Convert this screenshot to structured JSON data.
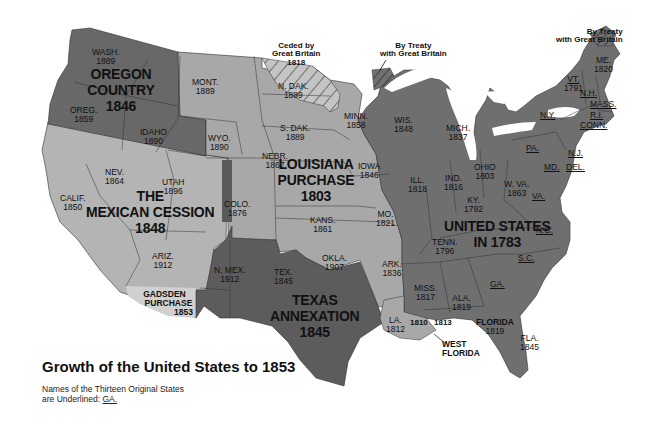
{
  "title": "Growth of the United States to 1853",
  "legend": {
    "line1": "Names of the Thirteen Original States",
    "line2_prefix": "are Underlined: ",
    "line2_example": "GA."
  },
  "colors": {
    "original_us": "#6e6e6e",
    "louisiana": "#a9a9a9",
    "oregon": "#6a6a6a",
    "mexican_cession": "#b4b4b4",
    "texas": "#5e5e5e",
    "florida": "#707070",
    "gadsden": "#cfcfcf",
    "ceded_hatch": "#bdbdbd",
    "border": "#333333"
  },
  "regions": {
    "oregon": {
      "name": "OREGON COUNTRY",
      "year": "1846"
    },
    "louisiana": {
      "name": "LOUISIANA PURCHASE",
      "year": "1803"
    },
    "mexican": {
      "name_line1": "THE",
      "name_line2": "MEXICAN CESSION",
      "year": "1848"
    },
    "us1783": {
      "name_line1": "UNITED STATES",
      "name_line2": "IN 1783"
    },
    "texas": {
      "name_line1": "TEXAS",
      "name_line2": "ANNEXATION",
      "year": "1845"
    },
    "gadsden": {
      "name_line1": "GADSDEN",
      "name_line2": "PURCHASE",
      "year": "1853"
    },
    "florida": {
      "name": "FLORIDA",
      "year": "1819"
    },
    "west_florida": {
      "name_line1": "WEST",
      "name_line2": "FLORIDA",
      "year_a": "1810",
      "year_b": "1813"
    }
  },
  "annotations": {
    "ceded": {
      "line1": "Ceded by",
      "line2": "Great Britain",
      "year": "1818"
    },
    "treaty_mid": {
      "line1": "By Treaty",
      "line2": "with Great Britain"
    },
    "treaty_ne": {
      "line1": "By Treaty",
      "line2": "with Great Britain"
    }
  },
  "states": {
    "wash": {
      "name": "WASH.",
      "year": "1889"
    },
    "oreg": {
      "name": "OREG.",
      "year": "1859"
    },
    "idaho": {
      "name": "IDAHO",
      "year": "1890"
    },
    "mont": {
      "name": "MONT.",
      "year": "1889"
    },
    "wyo": {
      "name": "WYO.",
      "year": "1890"
    },
    "calif": {
      "name": "CALIF.",
      "year": "1850"
    },
    "nev": {
      "name": "NEV.",
      "year": "1864"
    },
    "utah": {
      "name": "UTAH",
      "year": "1896"
    },
    "ariz": {
      "name": "ARIZ.",
      "year": "1912"
    },
    "colo": {
      "name": "COLO.",
      "year": "1876"
    },
    "nmex": {
      "name": "N. MEX.",
      "year": "1912"
    },
    "ndak": {
      "name": "N. DAK.",
      "year": "1889"
    },
    "sdak": {
      "name": "S. DAK.",
      "year": "1889"
    },
    "nebr": {
      "name": "NEBR.",
      "year": "1867"
    },
    "kans": {
      "name": "KANS.",
      "year": "1861"
    },
    "okla": {
      "name": "OKLA.",
      "year": "1907"
    },
    "tex": {
      "name": "TEX.",
      "year": "1845"
    },
    "minn": {
      "name": "MINN.",
      "year": "1858"
    },
    "iowa": {
      "name": "IOWA",
      "year": "1846"
    },
    "mo": {
      "name": "MO.",
      "year": "1821"
    },
    "ark": {
      "name": "ARK.",
      "year": "1836"
    },
    "la": {
      "name": "LA.",
      "year": "1812"
    },
    "wis": {
      "name": "WIS.",
      "year": "1848"
    },
    "mich": {
      "name": "MICH.",
      "year": "1837"
    },
    "ill": {
      "name": "ILL.",
      "year": "1818"
    },
    "ind": {
      "name": "IND.",
      "year": "1816"
    },
    "ohio": {
      "name": "OHIO",
      "year": "1803"
    },
    "ky": {
      "name": "KY.",
      "year": "1792"
    },
    "tenn": {
      "name": "TENN.",
      "year": "1796"
    },
    "miss": {
      "name": "MISS.",
      "year": "1817"
    },
    "ala": {
      "name": "ALA.",
      "year": "1819"
    },
    "fla": {
      "name": "FLA.",
      "year": "1845"
    },
    "wva": {
      "name": "W. VA.",
      "year": "1863"
    },
    "va": {
      "name": "VA."
    },
    "nc": {
      "name": "N.C."
    },
    "sc": {
      "name": "S.C."
    },
    "ga": {
      "name": "GA."
    },
    "pa": {
      "name": "PA."
    },
    "md": {
      "name": "MD."
    },
    "del": {
      "name": "DEL."
    },
    "nj": {
      "name": "N.J."
    },
    "ny": {
      "name": "N.Y."
    },
    "conn": {
      "name": "CONN."
    },
    "ri": {
      "name": "R.I."
    },
    "mass": {
      "name": "MASS."
    },
    "nh": {
      "name": "N.H."
    },
    "vt": {
      "name": "VT.",
      "year": "1791"
    },
    "me": {
      "name": "ME.",
      "year": "1820"
    }
  }
}
